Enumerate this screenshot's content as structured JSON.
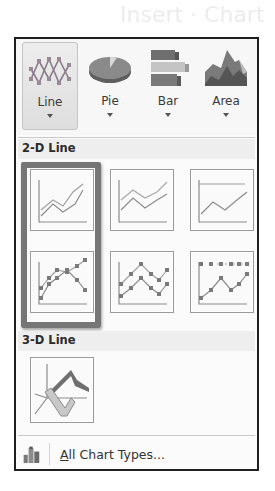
{
  "background_title": "Insert  ·  Chart",
  "ribbon": {
    "buttons": [
      {
        "label": "Line",
        "icon": "line-chart-icon",
        "active": true
      },
      {
        "label": "Pie",
        "icon": "pie-chart-icon",
        "active": false
      },
      {
        "label": "Bar",
        "icon": "bar-chart-icon",
        "active": false
      },
      {
        "label": "Area",
        "icon": "area-chart-icon",
        "active": false
      }
    ]
  },
  "sections": {
    "two_d": {
      "title": "2-D Line",
      "items": [
        {
          "name": "Line",
          "icon": "line-icon",
          "highlighted": true
        },
        {
          "name": "Stacked Line",
          "icon": "stacked-line-icon",
          "highlighted": false
        },
        {
          "name": "100% Stacked Line",
          "icon": "100-stacked-line-icon",
          "highlighted": false
        },
        {
          "name": "Line with Markers",
          "icon": "line-with-markers-icon",
          "highlighted": true
        },
        {
          "name": "Stacked Line with Markers",
          "icon": "stacked-line-markers-icon",
          "highlighted": false
        },
        {
          "name": "100% Stacked Line with Markers",
          "icon": "100-stacked-line-markers-icon",
          "highlighted": false
        }
      ]
    },
    "three_d": {
      "title": "3-D Line",
      "items": [
        {
          "name": "3-D Line",
          "icon": "3d-line-icon",
          "highlighted": false
        }
      ]
    }
  },
  "footer": {
    "accesskey": "A",
    "label_rest": "ll Chart Types...",
    "icon": "all-chart-types-icon"
  },
  "colors": {
    "frame_border": "#1e1e1e",
    "highlight_border": "#767676",
    "thumb_border": "#9a9a9a"
  }
}
